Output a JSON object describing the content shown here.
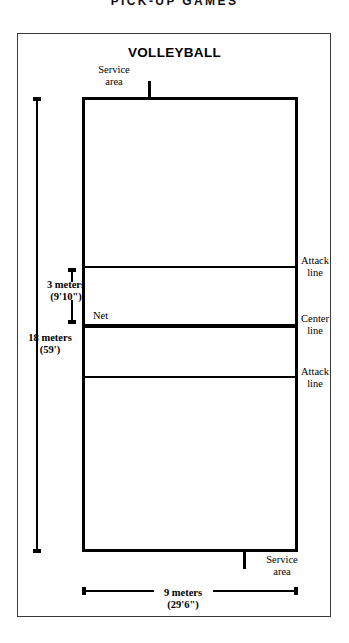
{
  "page": {
    "heading": "PICK-UP GAMES"
  },
  "figure": {
    "title": "VOLLEYBALL",
    "labels": {
      "service_area_top": "Service\narea",
      "service_area_top_line1": "Service",
      "service_area_top_line2": "area",
      "service_area_bottom_line1": "Service",
      "service_area_bottom_line2": "area",
      "net": "Net",
      "attack_line_top_line1": "Attack",
      "attack_line_top_line2": "line",
      "center_line_line1": "Center",
      "center_line_line2": "line",
      "attack_line_bottom_line1": "Attack",
      "attack_line_bottom_line2": "line"
    },
    "dimensions": {
      "attack_distance_metric": "3 meters",
      "attack_distance_imperial": "(9'10\")",
      "court_length_metric": "18 meters",
      "court_length_imperial": "(59')",
      "court_width_metric": "9 meters",
      "court_width_imperial": "(29'6\")"
    },
    "colors": {
      "line": "#000000",
      "frame": "#3a3a3a",
      "background": "#ffffff"
    }
  }
}
